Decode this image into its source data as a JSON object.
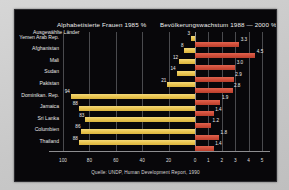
{
  "figure": {
    "title_left": "Alphabetisierte Frauen 1985 %",
    "title_right": "Bevölkerungswachstum 1988 — 2000 %",
    "category_header": "Ausgewählte Länder",
    "source": "Quelle: UNDP, Human Development Report, 1990"
  },
  "chart_data": {
    "type": "bar",
    "orientation": "horizontal",
    "layout": "bidirectional-butterfly",
    "categories": [
      "Yemen Arab Rep.",
      "Afghanistan",
      "Mali",
      "Sudan",
      "Pakistan",
      "Dominikan. Rep.",
      "Jamaica",
      "Sri Lanka",
      "Columbien",
      "Thailand"
    ],
    "series": [
      {
        "name": "Alphabetisierte Frauen 1985 %",
        "side": "left",
        "color": "#e9c44f",
        "axis_label": "Alphabetisierte Frauen 1985 %",
        "ticks": [
          100,
          80,
          60,
          40,
          20,
          0
        ],
        "xlim": [
          100,
          0
        ],
        "values": [
          3,
          8,
          12,
          14,
          21,
          94,
          88,
          83,
          86,
          88
        ]
      },
      {
        "name": "Bevölkerungswachstum 1988 — 2000 %",
        "side": "right",
        "color": "#cf4c38",
        "axis_label": "Bevölkerungswachstum 1988 — 2000 %",
        "ticks": [
          0,
          1,
          2,
          3,
          4,
          5
        ],
        "xlim": [
          0,
          5
        ],
        "values": [
          3.3,
          4.5,
          3.0,
          2.9,
          2.8,
          1.9,
          1.4,
          1.2,
          1.8,
          1.4
        ]
      }
    ],
    "grid": true,
    "legend": "none",
    "background": "#08070a"
  },
  "colors": {
    "panel_background": "#08070a",
    "page_background": "#cfcfcf",
    "left_bar": "#e9c44f",
    "right_bar": "#cf4c38",
    "axis": "#8d8d90",
    "grid": "#4a4a4e",
    "text": "#ededed"
  }
}
